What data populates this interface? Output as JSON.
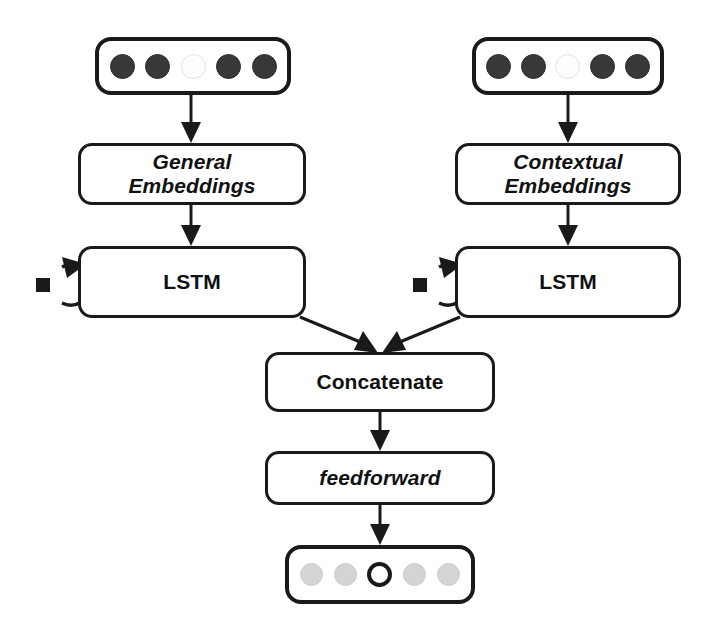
{
  "diagram": {
    "background_color": "#ffffff",
    "stroke_color": "#1a1a1a",
    "dot_dark_color": "#383838",
    "dot_light_color": "#d4d4d4",
    "dot_empty_color": "#fdfdfd"
  },
  "nodes": {
    "left_input_vector": {
      "name": "left input token vector",
      "dots": [
        "filled-dark",
        "filled-dark",
        "empty-light",
        "filled-dark",
        "filled-dark"
      ]
    },
    "right_input_vector": {
      "name": "right input token vector",
      "dots": [
        "filled-dark",
        "filled-dark",
        "empty-light",
        "filled-dark",
        "filled-dark"
      ]
    },
    "general_embeddings": {
      "label": "General\nEmbeddings",
      "style": "bold-italic"
    },
    "contextual_embeddings": {
      "label": "Contextual\nEmbeddings",
      "style": "bold-italic"
    },
    "left_lstm": {
      "label": "LSTM",
      "style": "bold"
    },
    "right_lstm": {
      "label": "LSTM",
      "style": "bold"
    },
    "concatenate": {
      "label": "Concatenate",
      "style": "bold"
    },
    "feedforward": {
      "label": "feedforward",
      "style": "bold-italic"
    },
    "output_vector": {
      "name": "output prediction vector",
      "dots": [
        "filled-gray",
        "filled-gray",
        "outlined-dark",
        "filled-gray",
        "filled-gray"
      ]
    }
  },
  "edges": [
    {
      "from": "left_input_vector",
      "to": "general_embeddings",
      "kind": "arrow-down"
    },
    {
      "from": "right_input_vector",
      "to": "contextual_embeddings",
      "kind": "arrow-down"
    },
    {
      "from": "general_embeddings",
      "to": "left_lstm",
      "kind": "arrow-down"
    },
    {
      "from": "contextual_embeddings",
      "to": "right_lstm",
      "kind": "arrow-down"
    },
    {
      "from": "left_lstm",
      "to": "left_lstm",
      "kind": "self-loop"
    },
    {
      "from": "right_lstm",
      "to": "right_lstm",
      "kind": "self-loop"
    },
    {
      "from": "left_lstm",
      "to": "concatenate",
      "kind": "arrow-diagonal"
    },
    {
      "from": "right_lstm",
      "to": "concatenate",
      "kind": "arrow-diagonal"
    },
    {
      "from": "concatenate",
      "to": "feedforward",
      "kind": "arrow-down"
    },
    {
      "from": "feedforward",
      "to": "output_vector",
      "kind": "arrow-down"
    }
  ]
}
